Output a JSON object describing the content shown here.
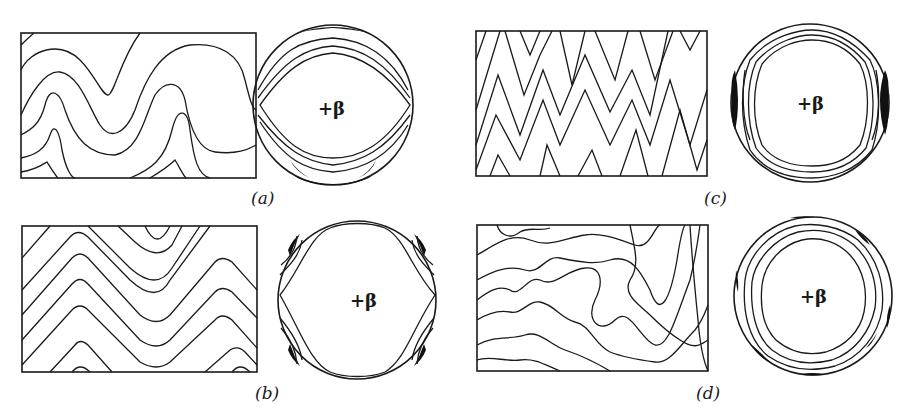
{
  "figure": {
    "panels": [
      {
        "id": "a",
        "label": "(a)",
        "pole_label": "+β",
        "description": "rounded, concentric fold profiles with stereonet showing girdle maxima at top and bottom"
      },
      {
        "id": "b",
        "label": "(b)",
        "pole_label": "+β",
        "description": "chevron-like angular folds with stereonet showing four maxima at diagonal positions"
      },
      {
        "id": "c",
        "label": "(c)",
        "pole_label": "+β",
        "description": "tight, closely spaced folds with stereonet showing maxima on left and right edges"
      },
      {
        "id": "d",
        "label": "(d)",
        "pole_label": "+β",
        "description": "disharmonic irregular folds with stereonet showing multiple small maxima around the primitive"
      }
    ]
  }
}
